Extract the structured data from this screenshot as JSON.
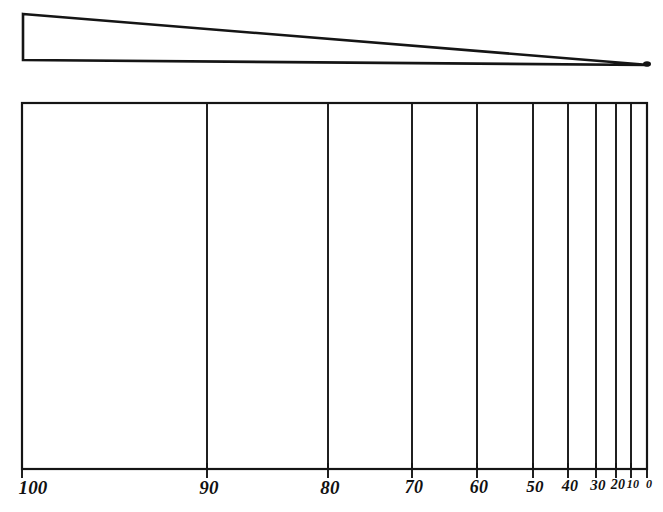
{
  "figure": {
    "background_color": "#ffffff",
    "ink_color": "#151515",
    "width": 663,
    "height": 512
  },
  "wedge": {
    "name": "tapered-wedge",
    "description": "Long thin triangular wedge tapering left to right, ending in a small solid blob at the right apex",
    "left_x": 23,
    "top_left_y": 14,
    "bottom_left_y": 60,
    "apex_x": 649,
    "apex_y": 65,
    "stroke_width": 2.6,
    "apex_blob_radius": 4
  },
  "panel": {
    "name": "graduated-panel",
    "left": 22,
    "right": 647,
    "top": 103,
    "bottom": 469,
    "stroke_width": 2.2,
    "tick_overhang": 9
  },
  "chart_data": {
    "type": "bar",
    "title": "",
    "xlabel": "",
    "ylabel": "",
    "orientation": "vertical-dividers",
    "note": "Vertical division lines on a nonlinear (compressing) scale running from 100 at the left edge to 0 at the right edge",
    "categories": [
      "100",
      "90",
      "80",
      "70",
      "60",
      "50",
      "40",
      "30",
      "20",
      "10",
      "0"
    ],
    "values": [
      100,
      90,
      80,
      70,
      60,
      50,
      40,
      30,
      20,
      10,
      0
    ],
    "pixel_positions": [
      22,
      207,
      328,
      412,
      477,
      533,
      568,
      596,
      616,
      631,
      647
    ],
    "xlim": [
      100,
      0
    ],
    "grid": true,
    "legend": "none"
  },
  "axis": {
    "name": "bottom-scale-axis",
    "ticks": [
      {
        "label": "100",
        "value": 100,
        "x": 22,
        "label_x": 33,
        "font_size": 19
      },
      {
        "label": "90",
        "value": 90,
        "x": 207,
        "label_x": 209,
        "font_size": 19
      },
      {
        "label": "80",
        "value": 80,
        "x": 328,
        "label_x": 330,
        "font_size": 19
      },
      {
        "label": "70",
        "value": 70,
        "x": 412,
        "label_x": 414,
        "font_size": 18
      },
      {
        "label": "60",
        "value": 60,
        "x": 477,
        "label_x": 479,
        "font_size": 18
      },
      {
        "label": "50",
        "value": 50,
        "x": 533,
        "label_x": 535,
        "font_size": 17
      },
      {
        "label": "40",
        "value": 40,
        "x": 568,
        "label_x": 570,
        "font_size": 16
      },
      {
        "label": "30",
        "value": 30,
        "x": 596,
        "label_x": 598,
        "font_size": 15
      },
      {
        "label": "20",
        "value": 20,
        "x": 616,
        "label_x": 618,
        "font_size": 14
      },
      {
        "label": "10",
        "value": 10,
        "x": 631,
        "label_x": 633,
        "font_size": 12
      },
      {
        "label": "0",
        "value": 0,
        "x": 647,
        "label_x": 649,
        "font_size": 12
      }
    ],
    "label_baseline_y": 478
  }
}
